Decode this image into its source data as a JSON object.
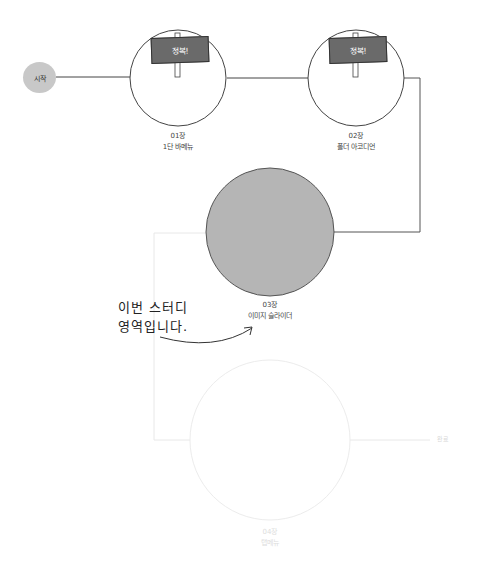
{
  "start": {
    "label": "시작"
  },
  "nodes": [
    {
      "chapter": "01장",
      "title": "1단 바메뉴",
      "status": "conquered",
      "sign": "정복!"
    },
    {
      "chapter": "02장",
      "title": "폴더 아코디언",
      "status": "conquered",
      "sign": "정복!"
    },
    {
      "chapter": "03장",
      "title": "이미지 슬라이더",
      "status": "current"
    },
    {
      "chapter": "04장",
      "title": "탭메뉴",
      "status": "upcoming"
    }
  ],
  "end": {
    "label": "완료"
  },
  "annotation": {
    "line1": "이번 스터디",
    "line2": "영역입니다."
  },
  "colors": {
    "current_fill": "#b5b5b5",
    "start_fill": "#c8c8c8",
    "sign_fill": "#6a6a6a",
    "line": "#444444",
    "faded": "#e6e6e6"
  }
}
